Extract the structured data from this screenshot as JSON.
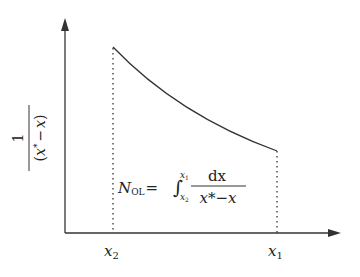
{
  "diagram": {
    "y_axis_label": {
      "numerator": "1",
      "denominator_open": "(",
      "denominator_var1": "x",
      "denominator_star": "*",
      "denominator_minus": "−",
      "denominator_var2": "x",
      "denominator_close": ")"
    },
    "x_ticks": [
      {
        "base": "x",
        "sub": "2"
      },
      {
        "base": "x",
        "sub": "1"
      }
    ],
    "equation": {
      "lhs_base": "N",
      "lhs_sub": "OL",
      "equals": "=",
      "integral": "∫",
      "upper_base": "x",
      "upper_sub": "1",
      "lower_base": "x",
      "lower_sub": "2",
      "numerator": "dx",
      "denominator": "x*−x"
    },
    "colors": {
      "line": "#333333",
      "background": "#ffffff"
    }
  }
}
